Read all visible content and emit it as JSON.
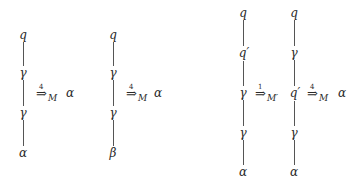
{
  "diagram": {
    "trees": [
      {
        "id": "t1",
        "x": 23,
        "nodes": [
          {
            "label": "q",
            "y": 35
          },
          {
            "label": "γ",
            "y": 73
          },
          {
            "label": "γ",
            "y": 113
          },
          {
            "label": "α",
            "y": 153
          }
        ]
      },
      {
        "id": "t2",
        "x": 113,
        "nodes": [
          {
            "label": "q",
            "y": 35
          },
          {
            "label": "γ",
            "y": 73
          },
          {
            "label": "γ",
            "y": 113
          },
          {
            "label": "β",
            "y": 153
          }
        ]
      },
      {
        "id": "t3",
        "x": 243,
        "nodes": [
          {
            "label": "q",
            "y": 13
          },
          {
            "label": "q′",
            "y": 53
          },
          {
            "label": "γ",
            "y": 93
          },
          {
            "label": "γ",
            "y": 133
          },
          {
            "label": "α",
            "y": 172
          }
        ]
      },
      {
        "id": "t4",
        "x": 294,
        "nodes": [
          {
            "label": "q",
            "y": 13
          },
          {
            "label": "γ",
            "y": 53
          },
          {
            "label": "q′",
            "y": 93
          },
          {
            "label": "γ",
            "y": 133
          },
          {
            "label": "α",
            "y": 172
          }
        ]
      }
    ],
    "arrows": [
      {
        "symbol": "⇒",
        "steps": "4",
        "machine": "M",
        "x": 36,
        "y": 94
      },
      {
        "symbol": "⇒",
        "steps": "4",
        "machine": "M",
        "x": 126,
        "y": 94
      },
      {
        "symbol": "⇒",
        "steps": "1",
        "machine": "M′",
        "x": 255,
        "y": 94
      },
      {
        "symbol": "⇒",
        "steps": "4",
        "machine": "M",
        "x": 307,
        "y": 94
      }
    ],
    "results": [
      {
        "label": "α",
        "x": 70,
        "y": 93
      },
      {
        "label": "α",
        "x": 158,
        "y": 93
      },
      {
        "label": "α",
        "x": 342,
        "y": 93
      }
    ]
  }
}
